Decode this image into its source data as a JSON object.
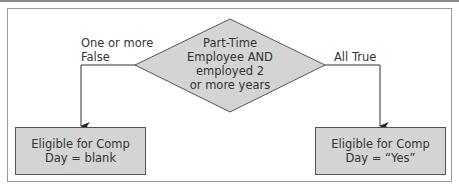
{
  "decision": {
    "lines": [
      "Part-Time",
      "Employee AND",
      "employed 2",
      "or more years"
    ]
  },
  "branches": {
    "left_label_lines": [
      "One or more",
      "False"
    ],
    "right_label": "All True"
  },
  "outcomes": {
    "left": {
      "lines": [
        "Eligible for Comp",
        "Day = blank"
      ]
    },
    "right": {
      "lines": [
        "Eligible for Comp",
        "Day = “Yes”"
      ]
    }
  },
  "colors": {
    "shape_fill": "#d4d4d4",
    "shape_stroke": "#555555",
    "line": "#333333",
    "frame": "#9a9a9a"
  }
}
